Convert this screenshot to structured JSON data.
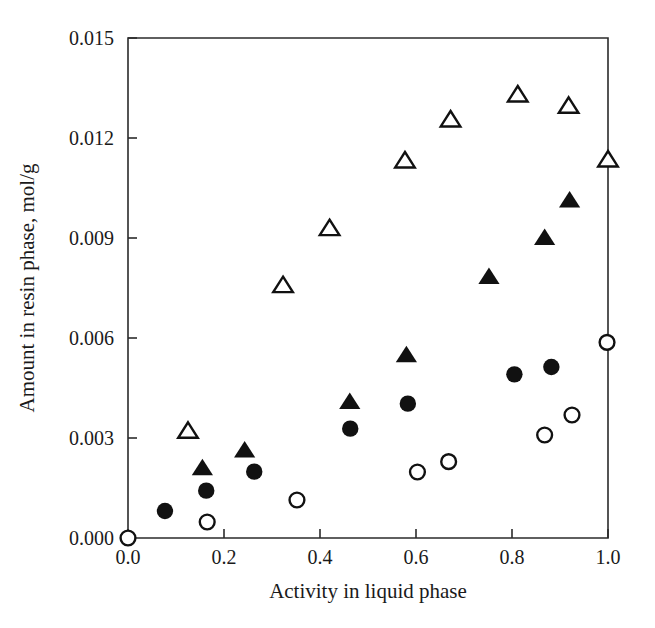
{
  "chart_data": {
    "type": "scatter",
    "title": "",
    "xlabel": "Activity in liquid phase",
    "ylabel": "Amount in resin phase, mol/g",
    "xlim": [
      0.0,
      1.0
    ],
    "ylim": [
      0.0,
      0.015
    ],
    "xticks": [
      0.0,
      0.2,
      0.4,
      0.6,
      0.8,
      1.0
    ],
    "xticklabels": [
      "0.0",
      "0.2",
      "0.4",
      "0.6",
      "0.8",
      "1.0"
    ],
    "yticks": [
      0.0,
      0.003,
      0.006,
      0.009,
      0.012,
      0.015
    ],
    "yticklabels": [
      "0.000",
      "0.003",
      "0.006",
      "0.009",
      "0.012",
      "0.015"
    ],
    "grid": false,
    "legend": "none",
    "series": [
      {
        "name": "open-triangle",
        "marker": "triangle-open",
        "color": "#111111",
        "points": [
          {
            "x": 0.125,
            "y": 0.0032
          },
          {
            "x": 0.323,
            "y": 0.00757
          },
          {
            "x": 0.42,
            "y": 0.00928
          },
          {
            "x": 0.577,
            "y": 0.01131
          },
          {
            "x": 0.672,
            "y": 0.01254
          },
          {
            "x": 0.812,
            "y": 0.01329
          },
          {
            "x": 0.918,
            "y": 0.01295
          },
          {
            "x": 1.0,
            "y": 0.01134
          }
        ]
      },
      {
        "name": "filled-triangle",
        "marker": "triangle-filled",
        "color": "#111111",
        "points": [
          {
            "x": 0.155,
            "y": 0.00209
          },
          {
            "x": 0.243,
            "y": 0.00262
          },
          {
            "x": 0.462,
            "y": 0.00408
          },
          {
            "x": 0.58,
            "y": 0.00548
          },
          {
            "x": 0.752,
            "y": 0.00783
          },
          {
            "x": 0.868,
            "y": 0.009
          },
          {
            "x": 0.92,
            "y": 0.01012
          }
        ]
      },
      {
        "name": "filled-circle",
        "marker": "circle-filled",
        "color": "#111111",
        "points": [
          {
            "x": 0.077,
            "y": 0.00081
          },
          {
            "x": 0.163,
            "y": 0.00142
          },
          {
            "x": 0.263,
            "y": 0.00199
          },
          {
            "x": 0.463,
            "y": 0.00328
          },
          {
            "x": 0.583,
            "y": 0.00403
          },
          {
            "x": 0.805,
            "y": 0.00491
          },
          {
            "x": 0.882,
            "y": 0.00513
          }
        ]
      },
      {
        "name": "open-circle",
        "marker": "circle-open",
        "color": "#111111",
        "points": [
          {
            "x": 0.0,
            "y": 0.0
          },
          {
            "x": 0.165,
            "y": 0.00048
          },
          {
            "x": 0.352,
            "y": 0.00114
          },
          {
            "x": 0.603,
            "y": 0.00198
          },
          {
            "x": 0.668,
            "y": 0.00229
          },
          {
            "x": 0.868,
            "y": 0.00309
          },
          {
            "x": 0.925,
            "y": 0.00369
          },
          {
            "x": 0.998,
            "y": 0.00587
          }
        ]
      }
    ]
  }
}
